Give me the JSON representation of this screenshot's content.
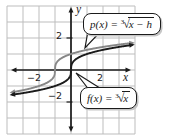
{
  "chart_data": {
    "type": "line",
    "title": "",
    "annotations": [
      "p(x) = ∛(x − h)",
      "f(x) = ∛x"
    ],
    "functions": [
      {
        "name": "p",
        "formula": "p(x) = ∛(x − h)",
        "h": -1,
        "color": "#878787"
      },
      {
        "name": "f",
        "formula": "f(x) = ∛x",
        "h": 0,
        "color": "#1b1b1b"
      }
    ],
    "x_domain": [
      -3.65,
      3.8
    ],
    "axes": {
      "x_label": "x",
      "y_label": "y",
      "x_range": [
        -4,
        4
      ],
      "y_range": [
        -4,
        4
      ],
      "grid": true,
      "x_tick_labels": [
        {
          "value": -2,
          "label": "−2"
        },
        {
          "value": 2,
          "label": "2"
        }
      ],
      "y_tick_labels": [
        {
          "value": -2,
          "label": "−2"
        },
        {
          "value": 2,
          "label": "2"
        }
      ]
    }
  },
  "callouts": {
    "p": {
      "prefix": "p(x) = ",
      "index": "3",
      "radicand": "x − h"
    },
    "f": {
      "prefix": "f(x) = ",
      "index": "3",
      "radicand": "x"
    }
  },
  "tick_labels": {
    "x_neg": "−2",
    "x_pos": "2",
    "y_neg": "−2",
    "y_pos": "2"
  },
  "axis_letters": {
    "x": "x",
    "y": "y"
  },
  "colors": {
    "axis": "#1b1b1b",
    "grid": "#bdbdbd",
    "curve_f": "#1b1b1b",
    "curve_p": "#878787",
    "background": "#ffffff",
    "callout_border": "#1b1b1b",
    "callout_bg": "#ffffff"
  }
}
